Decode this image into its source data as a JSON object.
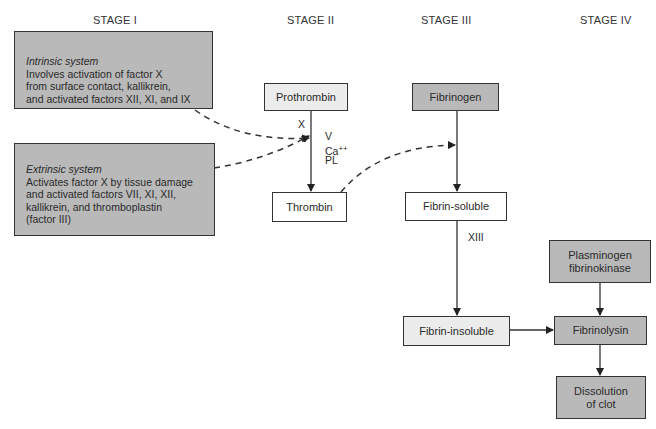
{
  "stages": [
    "STAGE I",
    "STAGE II",
    "STAGE III",
    "STAGE IV"
  ],
  "stage_1": {
    "intrinsic": {
      "title": "Intrinsic system",
      "lines": [
        "Involves activation of factor X",
        "from surface contact, kallikrein,",
        "and activated factors XII, XI, and IX"
      ]
    },
    "extrinsic": {
      "title": "Extrinsic system",
      "lines": [
        "Activates factor X by tissue damage",
        "and activated factors VII, XI, XII,",
        "kallikrein, and thromboplastin",
        "(factor III)"
      ]
    }
  },
  "stage_2": {
    "prothrombin": "Prothrombin",
    "thrombin": "Thrombin",
    "factor_x_label": "X",
    "cofactor_v": "V",
    "cofactor_ca": "Ca",
    "cofactor_ca_sup": "++",
    "cofactor_pl": "PL"
  },
  "stage_3": {
    "fibrinogen": "Fibrinogen",
    "fibrin_soluble": "Fibrin-soluble",
    "factor_xiii_label": "XIII",
    "fibrin_insoluble": "Fibrin-insoluble"
  },
  "stage_4": {
    "plasminogen_line1": "Plasminogen",
    "plasminogen_line2": "fibrinokinase",
    "fibrinolysin": "Fibrinolysin",
    "dissolution_line1": "Dissolution",
    "dissolution_line2": "of clot"
  },
  "colors": {
    "dark_box": "#b9b9b9",
    "light_box": "#ececec",
    "line": "#333333"
  }
}
